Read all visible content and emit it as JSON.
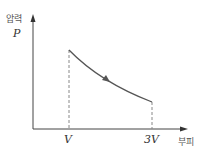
{
  "diagram": {
    "type": "PV-diagram",
    "y_axis": {
      "label": "압력",
      "symbol": "P"
    },
    "x_axis": {
      "label": "부피",
      "ticks": [
        "V",
        "3V"
      ]
    },
    "curve": {
      "from": "V",
      "to": "3V",
      "direction": "expansion",
      "shape": "decreasing convex"
    },
    "colors": {
      "axis": "#444444",
      "curve": "#555555",
      "dashed": "#888888"
    }
  }
}
